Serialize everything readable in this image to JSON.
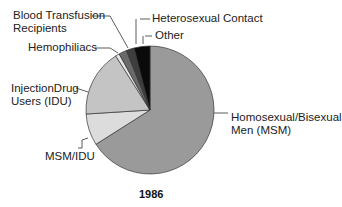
{
  "chart_data": {
    "type": "pie",
    "title": "1986",
    "slices": [
      {
        "label": "Homosexual/Bisexual Men (MSM)",
        "value": 66,
        "color": "#9a9a9a"
      },
      {
        "label": "MSM/IDU",
        "value": 8,
        "color": "#dcdcdc"
      },
      {
        "label": "InjectionDrug Users (IDU)",
        "value": 17,
        "color": "#c4c4c4"
      },
      {
        "label": "Hemophiliacs",
        "value": 1,
        "color": "#e6e6e6"
      },
      {
        "label": "Blood Transfusion Recipients",
        "value": 2,
        "color": "#6a6a6a"
      },
      {
        "label": "Heterosexual Contact",
        "value": 2,
        "color": "#3e3e3e"
      },
      {
        "label": "Other",
        "value": 4,
        "color": "#0a0a0a"
      }
    ]
  },
  "labels": {
    "transfusion_line1": "Blood Transfusion",
    "transfusion_line2": "Recipients",
    "heterosexual": "Heterosexual Contact",
    "other": "Other",
    "hemophiliacs": "Hemophiliacs",
    "idu_line1": "InjectionDrug",
    "idu_line2": "Users (IDU)",
    "msm_line1": "Homosexual/Bisexual",
    "msm_line2": "Men (MSM)",
    "msmidu": "MSM/IDU"
  },
  "title": "1986"
}
